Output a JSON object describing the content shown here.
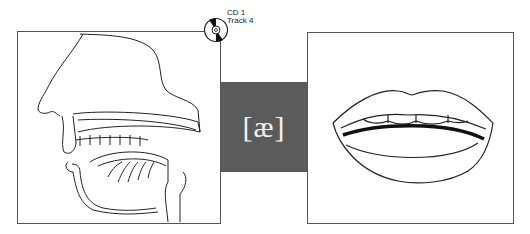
{
  "cd_badge": {
    "line1": "CD 1",
    "line2": "Track 4",
    "icon": "cd-disc-icon"
  },
  "phonetic_symbol": "[æ]",
  "panels": {
    "left": {
      "illustration": "sagittal-section-vocal-tract"
    },
    "right": {
      "illustration": "open-lips-mouth-front-view"
    }
  },
  "colors": {
    "symbol_box": "#5b5b5b",
    "frame_border": "#555555",
    "symbol_text": "#f2f2f2"
  }
}
